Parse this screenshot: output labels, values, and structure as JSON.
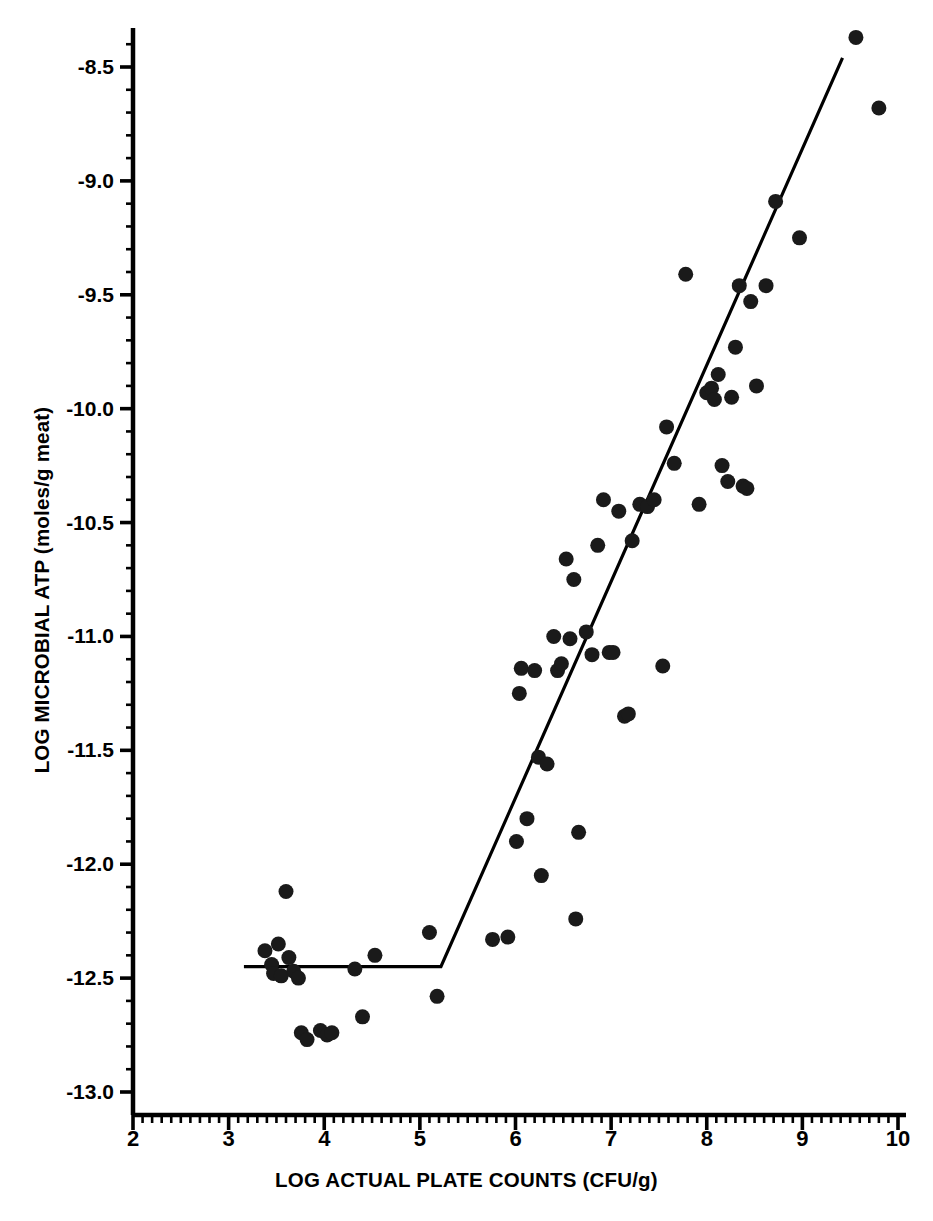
{
  "chart_data": {
    "type": "scatter",
    "title": "",
    "xlabel": "LOG ACTUAL PLATE COUNTS (CFU/g)",
    "ylabel": "LOG MICROBIAL ATP (moles/g meat)",
    "xlim": [
      2,
      10
    ],
    "ylim": [
      -13.05,
      -8.3
    ],
    "xticks": [
      2,
      3,
      4,
      5,
      6,
      7,
      8,
      9,
      10
    ],
    "xtick_labels": [
      "2",
      "3",
      "4",
      "5",
      "6",
      "7",
      "8",
      "9",
      "10"
    ],
    "yticks": [
      -8.5,
      -9.0,
      -9.5,
      -10.0,
      -10.5,
      -11.0,
      -11.5,
      -12.0,
      -12.5,
      -13.0
    ],
    "ytick_labels": [
      "-8.5",
      "-9.0",
      "-9.5",
      "-10.0",
      "-10.5",
      "-11.0",
      "-11.5",
      "-12.0",
      "-12.5",
      "-13.0"
    ],
    "minor_tick_interval_x": 0.1,
    "minor_tick_interval_y": 0.1,
    "grid": false,
    "legend": null,
    "marker": "filled-circle",
    "marker_color": "#1a1a1a",
    "marker_size_px": 15,
    "line_color": "#000000",
    "axis_color": "#000000",
    "background_color": "#ffffff",
    "fit_line": {
      "description": "segmented two-phase regression: flat plateau then linear rise",
      "type": "piecewise-linear",
      "points": [
        [
          3.16,
          -12.45
        ],
        [
          5.22,
          -12.45
        ],
        [
          9.42,
          -8.46
        ]
      ],
      "breakpoint_x": 5.22,
      "plateau_y": -12.45,
      "slope_after_break": 0.95
    },
    "points": [
      [
        3.38,
        -12.38
      ],
      [
        3.45,
        -12.44
      ],
      [
        3.47,
        -12.48
      ],
      [
        3.52,
        -12.35
      ],
      [
        3.55,
        -12.49
      ],
      [
        3.6,
        -12.12
      ],
      [
        3.63,
        -12.41
      ],
      [
        3.68,
        -12.47
      ],
      [
        3.73,
        -12.5
      ],
      [
        3.76,
        -12.74
      ],
      [
        3.82,
        -12.77
      ],
      [
        3.96,
        -12.73
      ],
      [
        4.03,
        -12.75
      ],
      [
        4.08,
        -12.74
      ],
      [
        4.32,
        -12.46
      ],
      [
        4.4,
        -12.67
      ],
      [
        4.53,
        -12.4
      ],
      [
        5.1,
        -12.3
      ],
      [
        5.18,
        -12.58
      ],
      [
        5.76,
        -12.33
      ],
      [
        5.92,
        -12.32
      ],
      [
        6.01,
        -11.9
      ],
      [
        6.04,
        -11.25
      ],
      [
        6.06,
        -11.14
      ],
      [
        6.12,
        -11.8
      ],
      [
        6.2,
        -11.15
      ],
      [
        6.24,
        -11.53
      ],
      [
        6.27,
        -12.05
      ],
      [
        6.33,
        -11.56
      ],
      [
        6.4,
        -11.0
      ],
      [
        6.44,
        -11.15
      ],
      [
        6.48,
        -11.12
      ],
      [
        6.53,
        -10.66
      ],
      [
        6.57,
        -11.01
      ],
      [
        6.61,
        -10.75
      ],
      [
        6.63,
        -12.24
      ],
      [
        6.66,
        -11.86
      ],
      [
        6.74,
        -10.98
      ],
      [
        6.8,
        -11.08
      ],
      [
        6.86,
        -10.6
      ],
      [
        6.92,
        -10.4
      ],
      [
        6.98,
        -11.07
      ],
      [
        7.02,
        -11.07
      ],
      [
        7.08,
        -10.45
      ],
      [
        7.14,
        -11.35
      ],
      [
        7.18,
        -11.34
      ],
      [
        7.22,
        -10.58
      ],
      [
        7.3,
        -10.42
      ],
      [
        7.38,
        -10.43
      ],
      [
        7.45,
        -10.4
      ],
      [
        7.54,
        -11.13
      ],
      [
        7.58,
        -10.08
      ],
      [
        7.66,
        -10.24
      ],
      [
        7.78,
        -9.41
      ],
      [
        7.92,
        -10.42
      ],
      [
        8.0,
        -9.93
      ],
      [
        8.05,
        -9.91
      ],
      [
        8.08,
        -9.96
      ],
      [
        8.12,
        -9.85
      ],
      [
        8.16,
        -10.25
      ],
      [
        8.22,
        -10.32
      ],
      [
        8.26,
        -9.95
      ],
      [
        8.3,
        -9.73
      ],
      [
        8.34,
        -9.46
      ],
      [
        8.38,
        -10.34
      ],
      [
        8.42,
        -10.35
      ],
      [
        8.46,
        -9.53
      ],
      [
        8.52,
        -9.9
      ],
      [
        8.62,
        -9.46
      ],
      [
        8.72,
        -9.09
      ],
      [
        8.97,
        -9.25
      ],
      [
        9.56,
        -8.37
      ],
      [
        9.8,
        -8.68
      ]
    ]
  },
  "icons": {
    "data_point": "filled-circle-marker"
  }
}
